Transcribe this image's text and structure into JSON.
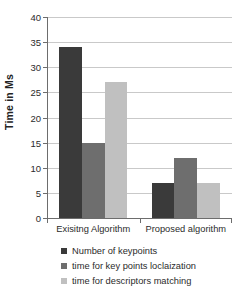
{
  "chart_data": {
    "type": "bar",
    "title": "",
    "subtitle": "",
    "xlabel": "",
    "ylabel": "Time in Ms",
    "categories": [
      "Exisitng Algorithm",
      "Proposed algorithm"
    ],
    "series": [
      {
        "name": "Number of keypoints",
        "color": "#3a3a3a",
        "values": [
          34,
          7
        ]
      },
      {
        "name": "time for key points loclaization",
        "color": "#6e6e6e",
        "values": [
          15,
          12
        ]
      },
      {
        "name": "time for descriptors matching",
        "color": "#c0c0c0",
        "values": [
          27,
          7
        ]
      }
    ],
    "ylim": [
      0,
      40
    ],
    "ytick_step": 5,
    "yticks": [
      0,
      5,
      10,
      15,
      20,
      25,
      30,
      35,
      40
    ],
    "ytick_labels": [
      "0",
      "5",
      "10",
      "15",
      "20",
      "25",
      "30",
      "35",
      "40"
    ],
    "grid": true,
    "grid_axis": "y",
    "legend_position": "bottom"
  },
  "colors": {
    "background": "#ffffff",
    "axis": "#6d6d6d",
    "gridline": "#c9c9c9",
    "text": "#2b2b2b",
    "series_1": "#3a3a3a",
    "series_2": "#6e6e6e",
    "series_3": "#c0c0c0"
  }
}
